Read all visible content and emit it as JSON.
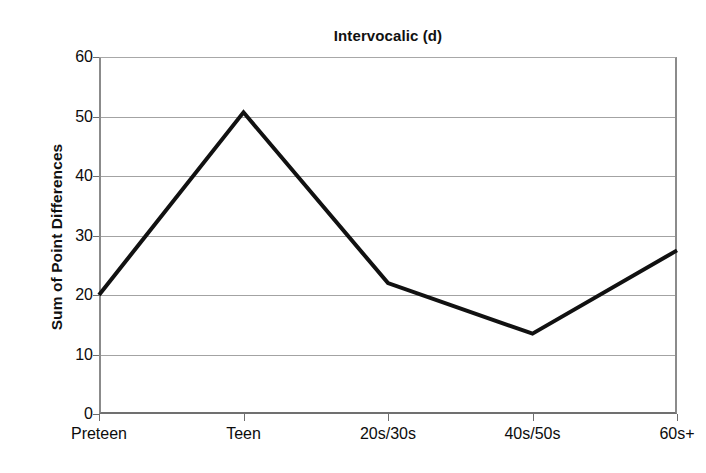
{
  "chart_data": {
    "type": "line",
    "title": "Intervocalic (d)",
    "xlabel": "",
    "ylabel": "Sum of Point Differences",
    "categories": [
      "Preteen",
      "Teen",
      "20s/30s",
      "40s/50s",
      "60s+"
    ],
    "values": [
      20.0,
      50.7,
      22.0,
      13.5,
      27.5
    ],
    "series": [
      {
        "name": "Intervocalic (d)",
        "values": [
          20.0,
          50.7,
          22.0,
          13.5,
          27.5
        ]
      }
    ],
    "ylim": [
      0,
      60
    ],
    "y_ticks": [
      0,
      10,
      20,
      30,
      40,
      50,
      60
    ],
    "y_tick_labels": [
      "0",
      "10",
      "20",
      "30",
      "40",
      "50",
      "60"
    ],
    "grid": "horizontal",
    "legend": "none",
    "line_color": "#111111",
    "line_width": 4,
    "gridline_color": "#a3a3a3",
    "axis_color": "#8b8b8b",
    "background": "#ffffff"
  },
  "artifact": {
    "bottom_strip_text": " "
  }
}
